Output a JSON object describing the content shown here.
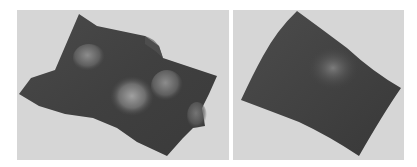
{
  "figure": {
    "panels": [
      {
        "id": "left",
        "description": "3D rendered shaded surface with multiple bumps (wavy sheet with two highlighted peaks)",
        "background_color": "#d6d6d6",
        "surface_color_dark": "#3a3a3a",
        "surface_color_mid": "#5a5a5a",
        "highlight_color": "#9a9a9a"
      },
      {
        "id": "right",
        "description": "3D rendered shaded smooth surface, single gentle dome",
        "background_color": "#d6d6d6",
        "surface_color_dark": "#3c3c3c",
        "surface_color_mid": "#555555",
        "highlight_color": "#7a7a7a"
      }
    ]
  }
}
